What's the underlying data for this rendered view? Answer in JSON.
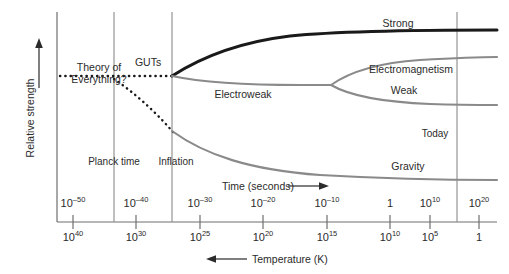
{
  "figure": {
    "axes": {
      "y_label": "Relative strength",
      "x_time_title": "Time (seconds)",
      "x_temp_title": "Temperature (K)",
      "time_arrow": "right-arrow",
      "temp_arrow": "left-arrow",
      "y_arrow": "up-arrow"
    },
    "time_ticks": [
      {
        "base": "10",
        "exp": "–50",
        "x": 73
      },
      {
        "base": "10",
        "exp": "–40",
        "x": 136
      },
      {
        "base": "10",
        "exp": "–30",
        "x": 200
      },
      {
        "base": "10",
        "exp": "–20",
        "x": 263
      },
      {
        "base": "10",
        "exp": "–10",
        "x": 327
      },
      {
        "base": "1",
        "exp": "",
        "x": 390
      },
      {
        "base": "10",
        "exp": "10",
        "x": 430
      },
      {
        "base": "10",
        "exp": "20",
        "x": 479
      }
    ],
    "temp_ticks": [
      {
        "base": "10",
        "exp": "40",
        "x": 73
      },
      {
        "base": "10",
        "exp": "30",
        "x": 136
      },
      {
        "base": "10",
        "exp": "25",
        "x": 200
      },
      {
        "base": "10",
        "exp": "20",
        "x": 263
      },
      {
        "base": "10",
        "exp": "15",
        "x": 327
      },
      {
        "base": "10",
        "exp": "10",
        "x": 390
      },
      {
        "base": "10",
        "exp": "5",
        "x": 430
      },
      {
        "base": "1",
        "exp": "",
        "x": 479
      }
    ],
    "markers": [
      {
        "label": "Planck time",
        "x": 114,
        "label_x": 114,
        "label_y": 158
      },
      {
        "label": "Inflation",
        "x": 172,
        "label_x": 176,
        "label_y": 158
      },
      {
        "label": "Today",
        "x": 457,
        "label_x": 435,
        "label_y": 130
      }
    ],
    "curve_labels": [
      {
        "label": "Strong",
        "x": 398,
        "y": 22
      },
      {
        "label": "Electroweak",
        "x": 243,
        "y": 88
      },
      {
        "label": "Electromagnetism",
        "x": 410,
        "y": 68
      },
      {
        "label": "Weak",
        "x": 403,
        "y": 88
      },
      {
        "label": "Gravity",
        "x": 408,
        "y": 164
      },
      {
        "label": "GUTs",
        "x": 148,
        "y": 62
      }
    ],
    "theory_of_everything": {
      "line1": "Theory of",
      "line2": "Everything?",
      "x": 98,
      "y": 68
    },
    "colors": {
      "strong": "#1a1a1a",
      "electroweak": "#8a8a8a",
      "gravity": "#8a8a8a",
      "axis": "#6e6e6e",
      "text": "#2b2b2b",
      "background": "#ffffff"
    }
  },
  "chart_data": {
    "type": "line",
    "xlabel": "Time (seconds)",
    "ylabel": "Relative strength",
    "secondary_xlabel": "Temperature (K)",
    "x_tick_labels": [
      "10^-50",
      "10^-40",
      "10^-30",
      "10^-20",
      "10^-10",
      "1",
      "10^10",
      "10^20"
    ],
    "secondary_x_tick_labels": [
      "10^40",
      "10^30",
      "10^25",
      "10^20",
      "10^15",
      "10^10",
      "10^5",
      "1"
    ],
    "grid": false,
    "legend": "inline-curve-labels",
    "annotations": [
      "Theory of Everything?",
      "GUTs",
      "Planck time",
      "Inflation",
      "Today"
    ],
    "series": [
      {
        "name": "Theory of Everything",
        "style": "dotted",
        "color": "#1a1a1a",
        "points": [
          [
            60,
            76
          ],
          [
            172,
            76
          ]
        ]
      },
      {
        "name": "Strong",
        "style": "solid-thick",
        "color": "#1a1a1a",
        "points": [
          [
            172,
            76
          ],
          [
            230,
            48
          ],
          [
            300,
            36
          ],
          [
            380,
            32
          ],
          [
            497,
            31
          ]
        ]
      },
      {
        "name": "Electroweak",
        "style": "solid",
        "color": "#8a8a8a",
        "points": [
          [
            172,
            76
          ],
          [
            230,
            82
          ],
          [
            300,
            84
          ],
          [
            330,
            84
          ]
        ]
      },
      {
        "name": "Electromagnetism",
        "style": "solid",
        "color": "#8a8a8a",
        "points": [
          [
            330,
            84
          ],
          [
            360,
            66
          ],
          [
            420,
            58
          ],
          [
            497,
            56
          ]
        ]
      },
      {
        "name": "Weak",
        "style": "solid",
        "color": "#8a8a8a",
        "points": [
          [
            330,
            84
          ],
          [
            370,
            96
          ],
          [
            430,
            102
          ],
          [
            497,
            104
          ]
        ]
      },
      {
        "name": "Gravity (dotted early)",
        "style": "dotted",
        "color": "#1a1a1a",
        "points": [
          [
            116,
            80
          ],
          [
            150,
            110
          ],
          [
            172,
            132
          ]
        ]
      },
      {
        "name": "Gravity",
        "style": "solid",
        "color": "#8a8a8a",
        "points": [
          [
            172,
            132
          ],
          [
            220,
            158
          ],
          [
            300,
            172
          ],
          [
            400,
            178
          ],
          [
            497,
            180
          ]
        ]
      }
    ]
  }
}
